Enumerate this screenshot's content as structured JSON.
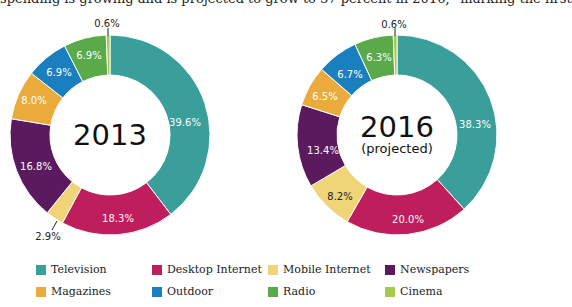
{
  "header": {
    "clipped_text": "spending is growing and is projected to grow to 37 percent in 2016,” marking the first"
  },
  "legend": [
    {
      "label": "Television",
      "color": "#3a9e9a"
    },
    {
      "label": "Desktop Internet",
      "color": "#be1e5c"
    },
    {
      "label": "Mobile Internet",
      "color": "#f0d478"
    },
    {
      "label": "Newspapers",
      "color": "#5c1a5e"
    },
    {
      "label": "Magazines",
      "color": "#eaaa3c"
    },
    {
      "label": "Outdoor",
      "color": "#1a7fbf"
    },
    {
      "label": "Radio",
      "color": "#5aaa4a"
    },
    {
      "label": "Cinema",
      "color": "#a6c84e"
    }
  ],
  "charts": [
    {
      "title": "2013",
      "subtitle": "",
      "labels": [
        "39.6%",
        "18.3%",
        "2.9%",
        "16.8%",
        "8.0%",
        "6.9%",
        "6.9%",
        "0.6%"
      ]
    },
    {
      "title": "2016",
      "subtitle": "(projected)",
      "labels": [
        "38.3%",
        "20.0%",
        "8.2%",
        "13.4%",
        "6.5%",
        "6.7%",
        "6.3%",
        "0.6%"
      ]
    }
  ],
  "chart_data": [
    {
      "type": "pie",
      "title": "2013",
      "categories": [
        "Television",
        "Desktop Internet",
        "Mobile Internet",
        "Newspapers",
        "Magazines",
        "Outdoor",
        "Radio",
        "Cinema"
      ],
      "values": [
        39.6,
        18.3,
        2.9,
        16.8,
        8.0,
        6.9,
        6.9,
        0.6
      ],
      "unit": "%",
      "style": "donut",
      "legend_position": "bottom"
    },
    {
      "type": "pie",
      "title": "2016 (projected)",
      "categories": [
        "Television",
        "Desktop Internet",
        "Mobile Internet",
        "Newspapers",
        "Magazines",
        "Outdoor",
        "Radio",
        "Cinema"
      ],
      "values": [
        38.3,
        20.0,
        8.2,
        13.4,
        6.5,
        6.7,
        6.3,
        0.6
      ],
      "unit": "%",
      "style": "donut",
      "legend_position": "bottom"
    }
  ]
}
